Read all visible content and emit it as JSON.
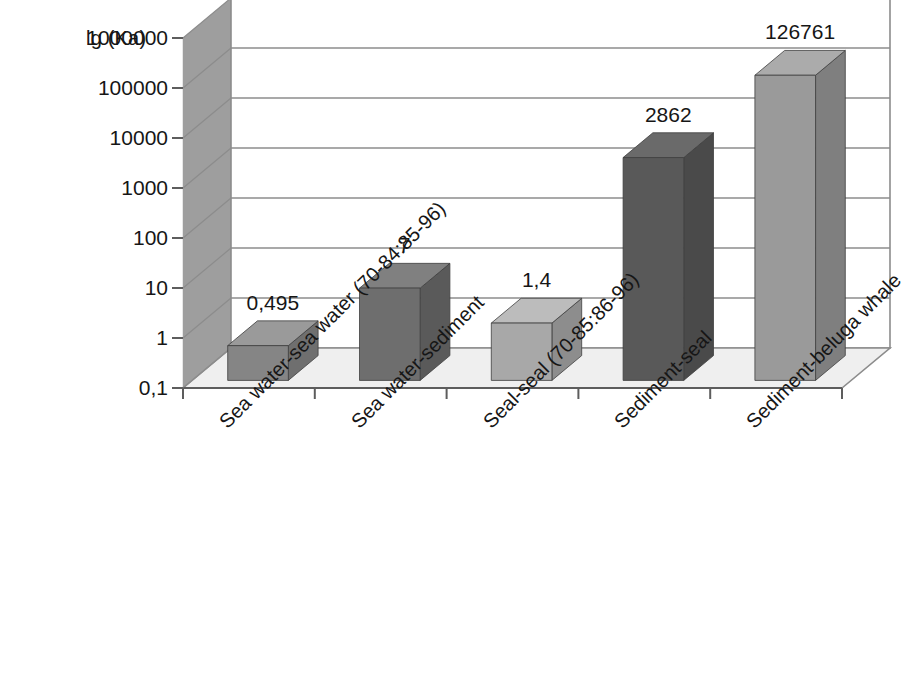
{
  "chart_data": {
    "type": "bar",
    "title": "",
    "subtitle": "",
    "ylabel": "lg (Ka)",
    "xlabel": "",
    "yscale": "log",
    "ylim": [
      0.1,
      1000000
    ],
    "grid": true,
    "legend": false,
    "legend_position": "none",
    "three_d": true,
    "decimal_separator": "comma",
    "categories": [
      "Sea water-sea water (70-84:85-96)",
      "Sea water-sediment",
      "Seal-seal (70-85:86-96)",
      "Sediment-seal",
      "Sediment-beluga whale"
    ],
    "values": [
      0.495,
      7,
      1.4,
      2862,
      126761
    ],
    "value_labels": [
      "0,495",
      "7",
      "1,4",
      "2862",
      "126761"
    ],
    "ytick_labels": [
      "1000000",
      "100000",
      "10000",
      "1000",
      "100",
      "10",
      "1",
      "0,1"
    ],
    "ytick_values": [
      1000000,
      100000,
      10000,
      1000,
      100,
      10,
      1,
      0.1
    ],
    "bar_colors": [
      "#858585",
      "#6e6e6e",
      "#a8a8a8",
      "#595959",
      "#9a9a9a"
    ],
    "bar_side_colors": [
      "#6f6f6f",
      "#5a5a5a",
      "#8d8d8d",
      "#4a4a4a",
      "#7f7f7f"
    ],
    "bar_top_colors": [
      "#9a9a9a",
      "#808080",
      "#bcbcbc",
      "#6a6a6a",
      "#ababab"
    ],
    "wall_color": "#9e9e9e",
    "floor_color": "#efefef",
    "gridline_color": "#8c8c8c",
    "axis_color": "#5d5d5d",
    "background_color": "#ffffff",
    "text_color": "#161616"
  }
}
